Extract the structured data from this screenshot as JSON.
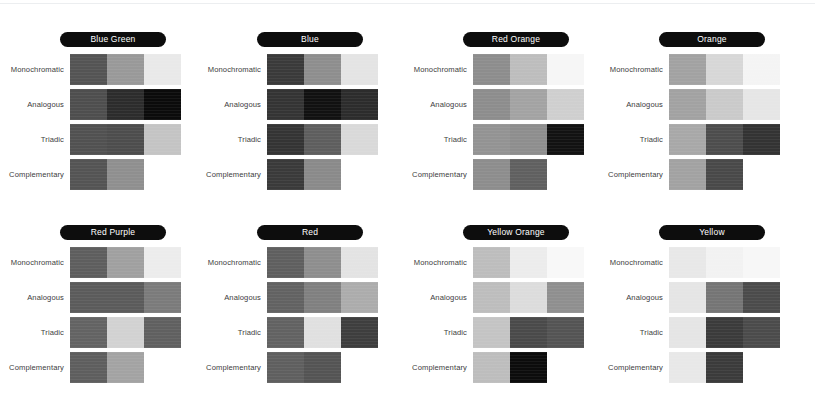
{
  "page": {
    "background": "#ffffff",
    "rule_color": "#eceef0"
  },
  "row_labels": [
    "Monochromatic",
    "Analogous",
    "Triadic",
    "Complementary"
  ],
  "panels": [
    {
      "name": "Blue Green",
      "x": 0,
      "y": 32,
      "rows": [
        {
          "label": "Monochromatic",
          "swatches": [
            "#545454",
            "#999999",
            "#e9e9e9"
          ]
        },
        {
          "label": "Analogous",
          "swatches": [
            "#4e4e4e",
            "#2c2c2c",
            "#0b0b0b"
          ]
        },
        {
          "label": "Triadic",
          "swatches": [
            "#515151",
            "#4d4d4d",
            "#c4c4c4"
          ]
        },
        {
          "label": "Complementary",
          "swatches": [
            "#545454",
            "#8f8f8f"
          ]
        }
      ]
    },
    {
      "name": "Blue",
      "x": 197,
      "y": 32,
      "rows": [
        {
          "label": "Monochromatic",
          "swatches": [
            "#3a3a3a",
            "#8e8e8e",
            "#e4e4e4"
          ]
        },
        {
          "label": "Analogous",
          "swatches": [
            "#343434",
            "#111111",
            "#2c2c2c"
          ]
        },
        {
          "label": "Triadic",
          "swatches": [
            "#343434",
            "#5e5e5e",
            "#d9d9d9"
          ]
        },
        {
          "label": "Complementary",
          "swatches": [
            "#3a3a3a",
            "#8a8a8a"
          ]
        }
      ]
    },
    {
      "name": "Red Orange",
      "x": 403,
      "y": 32,
      "rows": [
        {
          "label": "Monochromatic",
          "swatches": [
            "#8d8d8d",
            "#bdbdbd",
            "#f6f6f6"
          ]
        },
        {
          "label": "Analogous",
          "swatches": [
            "#8d8d8d",
            "#a3a3a3",
            "#cfcfcf"
          ]
        },
        {
          "label": "Triadic",
          "swatches": [
            "#939393",
            "#8e8e8e",
            "#121212"
          ]
        },
        {
          "label": "Complementary",
          "swatches": [
            "#8d8d8d",
            "#606060"
          ]
        }
      ]
    },
    {
      "name": "Orange",
      "x": 599,
      "y": 32,
      "rows": [
        {
          "label": "Monochromatic",
          "swatches": [
            "#a2a2a2",
            "#d7d7d7",
            "#f4f4f4"
          ]
        },
        {
          "label": "Analogous",
          "swatches": [
            "#a2a2a2",
            "#cacaca",
            "#e6e6e6"
          ]
        },
        {
          "label": "Triadic",
          "swatches": [
            "#a8a8a8",
            "#4d4d4d",
            "#333333"
          ]
        },
        {
          "label": "Complementary",
          "swatches": [
            "#a2a2a2",
            "#494949"
          ]
        }
      ]
    },
    {
      "name": "Red Purple",
      "x": 0,
      "y": 225,
      "rows": [
        {
          "label": "Monochromatic",
          "swatches": [
            "#5e5e5e",
            "#a0a0a0",
            "#ececec"
          ]
        },
        {
          "label": "Analogous",
          "swatches": [
            "#5b5b5b",
            "#5b5b5b",
            "#7b7b7b"
          ]
        },
        {
          "label": "Triadic",
          "swatches": [
            "#636363",
            "#d2d2d2",
            "#606060"
          ]
        },
        {
          "label": "Complementary",
          "swatches": [
            "#5e5e5e",
            "#a3a3a3"
          ]
        }
      ]
    },
    {
      "name": "Red",
      "x": 197,
      "y": 225,
      "rows": [
        {
          "label": "Monochromatic",
          "swatches": [
            "#5f5f5f",
            "#8e8e8e",
            "#e3e3e3"
          ]
        },
        {
          "label": "Analogous",
          "swatches": [
            "#626262",
            "#808080",
            "#acacac"
          ]
        },
        {
          "label": "Triadic",
          "swatches": [
            "#626262",
            "#e0e0e0",
            "#3e3e3e"
          ]
        },
        {
          "label": "Complementary",
          "swatches": [
            "#5f5f5f",
            "#545454"
          ]
        }
      ]
    },
    {
      "name": "Yellow Orange",
      "x": 403,
      "y": 225,
      "rows": [
        {
          "label": "Monochromatic",
          "swatches": [
            "#bdbdbd",
            "#ececec",
            "#f8f8f8"
          ]
        },
        {
          "label": "Analogous",
          "swatches": [
            "#bdbdbd",
            "#dcdcdc",
            "#8f8f8f"
          ]
        },
        {
          "label": "Triadic",
          "swatches": [
            "#c4c4c4",
            "#4a4a4a",
            "#545454"
          ]
        },
        {
          "label": "Complementary",
          "swatches": [
            "#bdbdbd",
            "#0c0c0c"
          ]
        }
      ]
    },
    {
      "name": "Yellow",
      "x": 599,
      "y": 225,
      "rows": [
        {
          "label": "Monochromatic",
          "swatches": [
            "#e8e8e8",
            "#f2f2f2",
            "#f7f7f7"
          ]
        },
        {
          "label": "Analogous",
          "swatches": [
            "#e5e5e5",
            "#757575",
            "#4b4b4b"
          ]
        },
        {
          "label": "Triadic",
          "swatches": [
            "#e5e5e5",
            "#3b3b3b",
            "#4b4b4b"
          ]
        },
        {
          "label": "Complementary",
          "swatches": [
            "#e8e8e8",
            "#3b3b3b"
          ]
        }
      ]
    }
  ]
}
